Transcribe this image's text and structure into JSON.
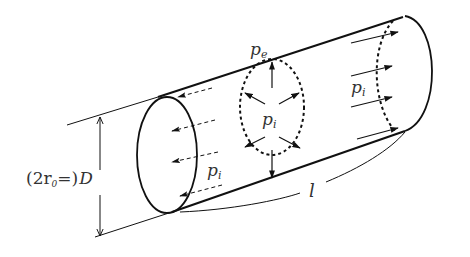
{
  "diagram": {
    "labels": {
      "external_pressure": {
        "symbol": "p",
        "subscript": "e"
      },
      "internal_pressure_center": {
        "symbol": "p",
        "subscript": "i"
      },
      "internal_pressure_left": {
        "symbol": "p",
        "subscript": "i"
      },
      "internal_pressure_right": {
        "symbol": "p",
        "subscript": "i"
      },
      "diameter_prefix": "(2r",
      "diameter_prefix_sub": "0",
      "diameter_eq": "=)",
      "diameter_symbol": "D",
      "length_symbol": "l"
    },
    "colors": {
      "stroke": "#111111",
      "text": "#333333",
      "background": "#ffffff"
    }
  }
}
